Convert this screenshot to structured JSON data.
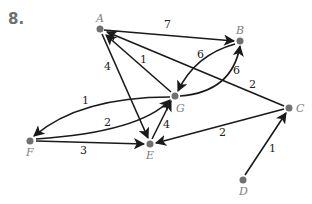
{
  "problem": {
    "number": "8."
  },
  "nodes": [
    {
      "id": "A",
      "label": "A",
      "x": 100,
      "y": 29
    },
    {
      "id": "B",
      "label": "B",
      "x": 240,
      "y": 41
    },
    {
      "id": "G",
      "label": "G",
      "x": 175,
      "y": 96
    },
    {
      "id": "C",
      "label": "C",
      "x": 289,
      "y": 108
    },
    {
      "id": "E",
      "label": "E",
      "x": 150,
      "y": 144
    },
    {
      "id": "F",
      "label": "F",
      "x": 30,
      "y": 141
    },
    {
      "id": "D",
      "label": "D",
      "x": 243,
      "y": 180
    }
  ],
  "edges": [
    {
      "from": "A",
      "to": "B",
      "weight": "7"
    },
    {
      "from": "A",
      "to": "E",
      "weight": "4"
    },
    {
      "from": "G",
      "to": "A",
      "weight": "1"
    },
    {
      "from": "C",
      "to": "A",
      "weight": "2"
    },
    {
      "from": "B",
      "to": "G",
      "weight": "6"
    },
    {
      "from": "G",
      "to": "B",
      "weight": "6"
    },
    {
      "from": "G",
      "to": "F",
      "weight": "1"
    },
    {
      "from": "F",
      "to": "G",
      "weight": "2"
    },
    {
      "from": "F",
      "to": "E",
      "weight": "3"
    },
    {
      "from": "E",
      "to": "G",
      "weight": "4"
    },
    {
      "from": "C",
      "to": "E",
      "weight": "2"
    },
    {
      "from": "D",
      "to": "C",
      "weight": "1"
    }
  ],
  "colors": {
    "node": "#707070",
    "edge": "#1a1a1a",
    "label": "#808080"
  }
}
